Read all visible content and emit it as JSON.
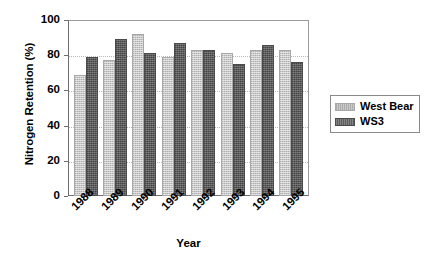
{
  "chart_data": {
    "type": "bar",
    "title": "",
    "xlabel": "Year",
    "ylabel": "Nitrogen Retention (%)",
    "ylim": [
      0,
      100
    ],
    "yticks": [
      0,
      20,
      40,
      60,
      80,
      100
    ],
    "grid": true,
    "legend_position": "right",
    "categories": [
      "1988",
      "1989",
      "1990",
      "1991",
      "1992",
      "1993",
      "1994",
      "1995"
    ],
    "series": [
      {
        "name": "West Bear",
        "color": "#c9c9c9",
        "values": [
          69,
          77,
          92,
          79,
          83,
          81,
          83,
          83
        ]
      },
      {
        "name": "WS3",
        "color": "#5d5d5d",
        "values": [
          79,
          89,
          81,
          87,
          83,
          75,
          86,
          76
        ]
      }
    ]
  },
  "axis": {
    "y_title": "Nitrogen Retention (%)",
    "x_title": "Year",
    "y_tick_labels": [
      "100",
      "80",
      "60",
      "40",
      "20",
      "0"
    ],
    "x_tick_labels": [
      "1988",
      "1989",
      "1990",
      "1991",
      "1992",
      "1993",
      "1994",
      "1995"
    ]
  },
  "legend": {
    "entries": [
      {
        "label": "West Bear",
        "swatch": "light-gray-swatch"
      },
      {
        "label": "WS3",
        "swatch": "dark-gray-swatch"
      }
    ]
  }
}
